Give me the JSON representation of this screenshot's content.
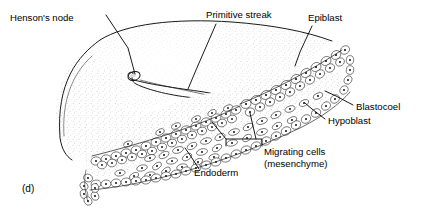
{
  "figure": {
    "panel_id": "(d)",
    "background_color": "#ffffff",
    "ink_color": "#000000",
    "style": "stippled-line-drawing"
  },
  "labels": [
    {
      "id": "hensons-node",
      "text": "Henson's node",
      "x": 10,
      "y": 21,
      "anchor": "start",
      "leader": "M 106 15 L 128 48 L 135 74"
    },
    {
      "id": "primitive-streak",
      "text": "Primitive streak",
      "x": 206,
      "y": 18,
      "anchor": "start",
      "leader": "M 216 24 L 196 70 L 188 89"
    },
    {
      "id": "epiblast",
      "text": "Epiblast",
      "x": 308,
      "y": 21,
      "anchor": "start",
      "leader": "M 312 26 L 300 52 L 295 66"
    },
    {
      "id": "blastocoel",
      "text": "Blastocoel",
      "x": 356,
      "y": 110,
      "anchor": "start",
      "leader": "M 353 105 L 336 96 L 325 91"
    },
    {
      "id": "hypoblast",
      "text": "Hypoblast",
      "x": 328,
      "y": 124,
      "anchor": "start",
      "leader": "M 325 119 L 312 109 L 305 103"
    },
    {
      "id": "migrating-cells-line1",
      "text": "Migrating cells",
      "x": 264,
      "y": 155,
      "anchor": "start",
      "leader": ""
    },
    {
      "id": "migrating-cells-line2",
      "text": "(mesenchyme)",
      "x": 264,
      "y": 167,
      "anchor": "start",
      "leader": ""
    },
    {
      "id": "endoderm",
      "text": "Endoderm",
      "x": 194,
      "y": 176,
      "anchor": "start",
      "leader": "M 199 169 L 190 155 L 185 148"
    }
  ],
  "migrating_bracket": {
    "path": "M 226 146 L 226 139 L 262 139 L 262 146",
    "stem_left": "M 226 139 L 212 122",
    "stem_right": "M 256 139 L 250 113"
  },
  "structures": [
    {
      "id": "epiblast-dome-surface",
      "description": "stippled convex dome forming the outer epiblast surface"
    },
    {
      "id": "primitive-streak-groove",
      "description": "elongate groove running from Henson's node toward the cut edge"
    },
    {
      "id": "hensons-node-knob",
      "description": "bulbous anterior end of the primitive streak"
    },
    {
      "id": "epiblast-cell-layer",
      "description": "upper columnar epithelial cell layer on the cut face"
    },
    {
      "id": "blastocoel-cavity",
      "description": "space between epiblast and hypoblast containing migrating cells"
    },
    {
      "id": "mesenchyme-cells",
      "description": "scattered loose migrating cells within the blastocoel"
    },
    {
      "id": "endoderm-hypoblast-layer",
      "description": "lower cell layer bounding the cavity"
    },
    {
      "id": "cut-face-wedge",
      "description": "sectioned wedge revealing internal germ layers"
    }
  ]
}
